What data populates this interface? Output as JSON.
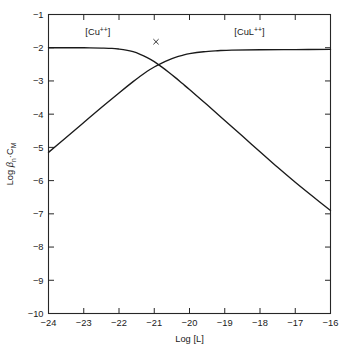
{
  "chart_data": {
    "type": "line",
    "title": "",
    "subtitle": "",
    "xlabel": "Log [L]",
    "ylabel": "Log βn·CM",
    "ylabel_parts": {
      "prefix": "Log ",
      "beta": "β",
      "beta_sub": "n",
      "middot": "·",
      "c": "C",
      "c_sub": "M"
    },
    "xlim": [
      -24,
      -16
    ],
    "ylim": [
      -10,
      -1
    ],
    "xticks": [
      -24,
      -23,
      -22,
      -21,
      -20,
      -19,
      -18,
      -17,
      -16
    ],
    "xtick_labels": [
      "−24",
      "−23",
      "−22",
      "−21",
      "−20",
      "−19",
      "−18",
      "−17",
      "−16"
    ],
    "yticks": [
      -1,
      -2,
      -3,
      -4,
      -5,
      -6,
      -7,
      -8,
      -9,
      -10
    ],
    "ytick_labels": [
      "−1",
      "−2",
      "−3",
      "−4",
      "−5",
      "−6",
      "−7",
      "−8",
      "−9",
      "−10"
    ],
    "grid": false,
    "legend_position": "inline-annotations",
    "tick_direction": "in",
    "frame": "full-box",
    "annotations": [
      {
        "name": "cu-species-label",
        "text": "[Cu++]",
        "base": "[Cu",
        "superscript": "++",
        "close": "]",
        "x": -22.6,
        "y": -1.62
      },
      {
        "name": "cul-species-label",
        "text": "[CuL++]",
        "base": "[CuL",
        "superscript": "++",
        "close": "]",
        "x": -18.3,
        "y": -1.62
      },
      {
        "name": "crossover-marker",
        "text": "×",
        "x": -20.95,
        "y": -1.82
      }
    ],
    "series": [
      {
        "name": "free-copper",
        "label": "[Cu++]",
        "comment": "Flat at -2 then descends with slope -1 past the crossover",
        "x": [
          -24.0,
          -23.5,
          -23.0,
          -22.5,
          -22.2,
          -22.0,
          -21.8,
          -21.6,
          -21.4,
          -21.2,
          -21.0,
          -20.8,
          -20.6,
          -20.4,
          -20.2,
          -20.0,
          -19.5,
          -19.0,
          -18.5,
          -18.0,
          -17.5,
          -17.0,
          -16.5,
          -16.0
        ],
        "values": [
          -2.0,
          -2.0,
          -2.0,
          -2.01,
          -2.02,
          -2.04,
          -2.07,
          -2.12,
          -2.2,
          -2.3,
          -2.42,
          -2.57,
          -2.73,
          -2.9,
          -3.08,
          -3.26,
          -3.72,
          -4.19,
          -4.66,
          -5.13,
          -5.6,
          -6.05,
          -6.48,
          -6.9
        ]
      },
      {
        "name": "copper-ligand-complex",
        "label": "[CuL++]",
        "comment": "Rises with slope +1 from lower left, saturates at about -2.05",
        "x": [
          -24.0,
          -23.5,
          -23.0,
          -22.5,
          -22.0,
          -21.6,
          -21.4,
          -21.2,
          -21.0,
          -20.8,
          -20.6,
          -20.4,
          -20.2,
          -20.0,
          -19.6,
          -19.2,
          -18.8,
          -18.0,
          -17.0,
          -16.0
        ],
        "values": [
          -5.15,
          -4.7,
          -4.25,
          -3.8,
          -3.36,
          -3.02,
          -2.86,
          -2.71,
          -2.58,
          -2.47,
          -2.37,
          -2.29,
          -2.23,
          -2.18,
          -2.12,
          -2.09,
          -2.07,
          -2.06,
          -2.055,
          -2.05
        ]
      }
    ]
  },
  "colors": {
    "axis": "#262626",
    "curve": "#1a1a1a",
    "background": "#ffffff"
  }
}
